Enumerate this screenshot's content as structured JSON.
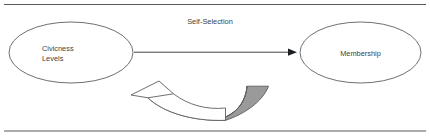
{
  "figure": {
    "background_color": "#ffffff",
    "rules": {
      "color": "#555a5e",
      "top_label": "top-divider",
      "bottom_label": "bottom-divider"
    }
  },
  "nodes": [
    {
      "id": "civicness",
      "shape": "ellipse",
      "label_lines": [
        "Civicness",
        "Levels"
      ],
      "line1": "Civicness",
      "line2": "Levels",
      "fill": "#ffffff",
      "stroke": "#5a5f63"
    },
    {
      "id": "membership",
      "shape": "ellipse",
      "label_lines": [
        "Membership"
      ],
      "line1": "Membership",
      "fill": "#ffffff",
      "stroke": "#5a5f63"
    }
  ],
  "edges": [
    {
      "id": "self-selection",
      "label": "Self-Selection",
      "from": "civicness",
      "to": "membership",
      "style": "straight-arrow",
      "direction": "right",
      "color": "#2e3234"
    },
    {
      "id": "feedback",
      "label": "",
      "from": "membership",
      "to": "civicness",
      "style": "curved-block-arrow",
      "direction": "left",
      "outline_fill": "#ffffff",
      "shade_fill": "#9a9a9a",
      "stroke": "#5a5f63"
    }
  ],
  "colors": {
    "text": "#3b3f42",
    "outline": "#5a5f63",
    "arrow": "#2e3234",
    "shade": "#9a9a9a",
    "rule": "#555a5e",
    "background": "#ffffff"
  }
}
